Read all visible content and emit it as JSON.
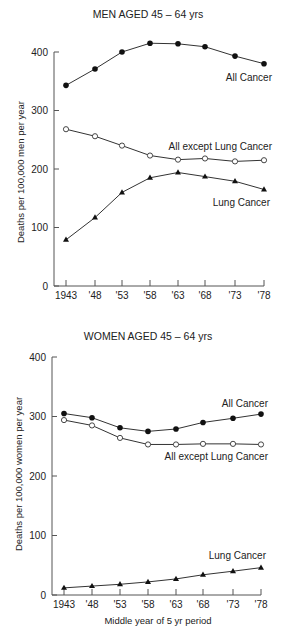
{
  "chart_data": [
    {
      "type": "line",
      "title": "MEN AGED 45 – 64 yrs",
      "xlabel": "",
      "ylabel": "Deaths per 100,000 men per year",
      "ylim": [
        0,
        400
      ],
      "yticks": [
        0,
        100,
        200,
        300,
        400
      ],
      "ytick_labels": [
        "0",
        "100",
        "200",
        "300",
        "400"
      ],
      "categories": [
        "1943",
        "'48",
        "'53",
        "'58",
        "'63",
        "'68",
        "'73",
        "'78"
      ],
      "grid": false,
      "legend": "inline-labels",
      "series": [
        {
          "name": "All Cancer",
          "marker": "filled-circle",
          "values": [
            343,
            371,
            400,
            415,
            414,
            409,
            393,
            380
          ]
        },
        {
          "name": "All except Lung Cancer",
          "marker": "open-circle",
          "values": [
            268,
            256,
            240,
            223,
            216,
            218,
            213,
            215
          ]
        },
        {
          "name": "Lung Cancer",
          "marker": "filled-triangle",
          "values": [
            79,
            117,
            160,
            185,
            194,
            187,
            179,
            165
          ]
        }
      ],
      "annotations": [
        {
          "text": "All Cancer",
          "series": "All Cancer"
        },
        {
          "text": "All except Lung Cancer",
          "series": "All except Lung Cancer"
        },
        {
          "text": "Lung Cancer",
          "series": "Lung Cancer"
        }
      ]
    },
    {
      "type": "line",
      "title": "WOMEN AGED 45 – 64 yrs",
      "xlabel": "Middle year of 5 yr period",
      "ylabel": "Deaths per 100,000 women per year",
      "ylim": [
        0,
        400
      ],
      "yticks": [
        0,
        100,
        200,
        300,
        400
      ],
      "ytick_labels": [
        "0",
        "100",
        "200",
        "300",
        "400"
      ],
      "categories": [
        "1943",
        "'48",
        "'53",
        "'58",
        "'63",
        "'68",
        "'73",
        "'78"
      ],
      "grid": false,
      "legend": "inline-labels",
      "series": [
        {
          "name": "All Cancer",
          "marker": "filled-circle",
          "values": [
            305,
            298,
            281,
            275,
            279,
            290,
            297,
            304
          ]
        },
        {
          "name": "All except Lung Cancer",
          "marker": "open-circle",
          "values": [
            294,
            285,
            264,
            253,
            253,
            254,
            254,
            253
          ]
        },
        {
          "name": "Lung Cancer",
          "marker": "filled-triangle",
          "values": [
            12,
            15,
            18,
            22,
            27,
            34,
            40,
            46
          ]
        }
      ],
      "annotations": [
        {
          "text": "All Cancer",
          "series": "All Cancer"
        },
        {
          "text": "All except Lung Cancer",
          "series": "All except Lung Cancer"
        },
        {
          "text": "Lung Cancer",
          "series": "Lung Cancer"
        }
      ]
    }
  ],
  "colors": {
    "ink": "#222222",
    "axis": "#555555",
    "background": "#ffffff"
  }
}
